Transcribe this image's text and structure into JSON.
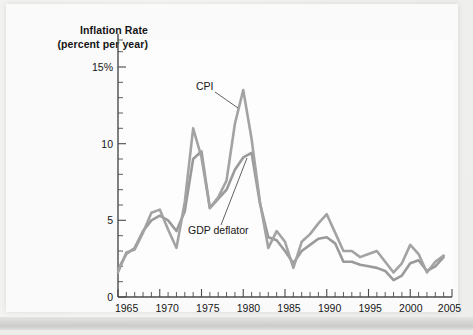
{
  "figure": {
    "title_line1": "Inflation Rate",
    "title_line2": "(percent per year)"
  },
  "annotations": {
    "cpi_label": "CPI",
    "gdp_label": "GDP deflator"
  },
  "axes": {
    "y_ticks": [
      "0",
      "5",
      "10",
      "15%"
    ],
    "x_ticks": [
      "1965",
      "1970",
      "1975",
      "1980",
      "1985",
      "1990",
      "1995",
      "2000",
      "2005"
    ]
  },
  "colors": {
    "line": "#9d9d9d",
    "axis": "#4a4a4a",
    "plot_background": "#fdfdfd",
    "page_background": "#f2f2f1"
  },
  "chart_data": {
    "type": "line",
    "title": "Inflation Rate (percent per year)",
    "xlabel": "",
    "ylabel": "Inflation Rate (percent per year)",
    "xlim": [
      1965,
      2005
    ],
    "ylim": [
      0,
      15
    ],
    "grid": false,
    "legend": "inline-annotations",
    "y_tick_values": [
      0,
      5,
      10,
      15
    ],
    "y_tick_labels": [
      "0",
      "5",
      "10",
      "15%"
    ],
    "x_tick_values": [
      1965,
      1970,
      1975,
      1980,
      1985,
      1990,
      1995,
      2000,
      2005
    ],
    "x_minor_tick_step": 1,
    "x": [
      1965,
      1966,
      1967,
      1968,
      1969,
      1970,
      1971,
      1972,
      1973,
      1974,
      1975,
      1976,
      1977,
      1978,
      1979,
      1980,
      1981,
      1982,
      1983,
      1984,
      1985,
      1986,
      1987,
      1988,
      1989,
      1990,
      1991,
      1992,
      1993,
      1994,
      1995,
      1996,
      1997,
      1998,
      1999,
      2000,
      2001,
      2002,
      2003,
      2004
    ],
    "series": [
      {
        "name": "CPI",
        "values": [
          1.6,
          2.9,
          3.1,
          4.2,
          5.5,
          5.7,
          4.4,
          3.2,
          6.2,
          11.0,
          9.1,
          5.8,
          6.5,
          7.6,
          11.3,
          13.5,
          10.3,
          6.2,
          3.2,
          4.3,
          3.6,
          1.9,
          3.6,
          4.1,
          4.8,
          5.4,
          4.2,
          3.0,
          3.0,
          2.6,
          2.8,
          3.0,
          2.3,
          1.6,
          2.2,
          3.4,
          2.8,
          1.6,
          2.3,
          2.7
        ]
      },
      {
        "name": "GDP deflator",
        "values": [
          1.8,
          2.8,
          3.2,
          4.3,
          5.0,
          5.3,
          5.0,
          4.3,
          5.6,
          9.0,
          9.5,
          5.8,
          6.4,
          7.0,
          8.3,
          9.1,
          9.4,
          6.1,
          3.9,
          3.7,
          3.0,
          2.2,
          3.0,
          3.4,
          3.8,
          3.9,
          3.5,
          2.3,
          2.3,
          2.1,
          2.0,
          1.9,
          1.7,
          1.1,
          1.4,
          2.2,
          2.4,
          1.7,
          2.0,
          2.6
        ]
      }
    ],
    "annotations": [
      {
        "text": "CPI",
        "near_x": 1978,
        "near_y": 13.0
      },
      {
        "text": "GDP deflator",
        "near_x": 1977,
        "near_y": 5.2
      }
    ]
  }
}
